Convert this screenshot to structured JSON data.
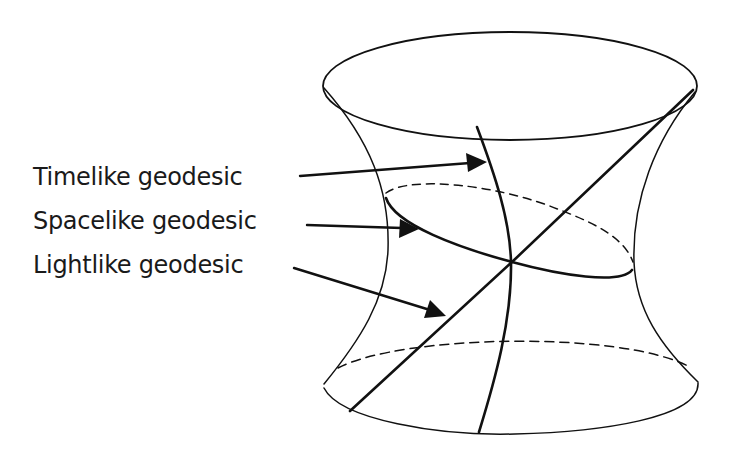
{
  "diagram": {
    "shape": "hyperboloid",
    "labels": [
      {
        "id": "timelike",
        "text": "Timelike geodesic",
        "x": 33,
        "y": 168
      },
      {
        "id": "spacelike",
        "text": "Spacelike geodesic",
        "x": 33,
        "y": 212
      },
      {
        "id": "lightlike",
        "text": "Lightlike geodesic",
        "x": 33,
        "y": 256
      }
    ],
    "colors": {
      "stroke": "#111111",
      "background": "#ffffff",
      "text": "#1a1a1a"
    }
  }
}
